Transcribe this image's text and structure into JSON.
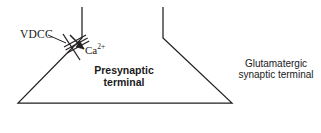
{
  "figure": {
    "background_color": "#ffffff",
    "stroke_color": "#231f20",
    "text_color": "#1a1a1a"
  },
  "labels": {
    "vdcc": "VDCC",
    "calcium_ion": "Ca",
    "calcium_charge": "2+",
    "presynaptic_line1": "Presynaptic",
    "presynaptic_line2": "terminal",
    "glutamatergic_line1": "Glutamatergic",
    "glutamatergic_line2": "synaptic terminal"
  },
  "geometry": {
    "terminal_outline": "M 82,7 L 82,38 L 18,103 L 232,103 L 163,38 L 163,7",
    "channel_bars": [
      "M 64,47 L 86,35",
      "M 65.6,50 L 87.6,38",
      "M 67.2,53 L 89.2,41"
    ],
    "channel_pore_line": "M 63,34 L 80,60",
    "arrow_line": "M 70,35 L 84,49",
    "arrow_head": "84,49 76,47 80,41",
    "vdcc_leader": "M 48,35 L 66,43"
  }
}
